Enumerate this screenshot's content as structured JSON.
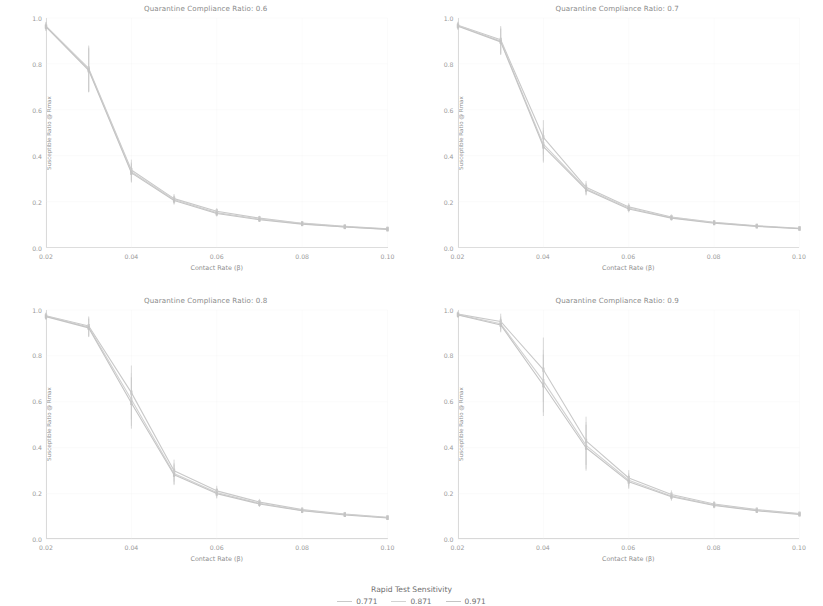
{
  "figure": {
    "xlabel": "Contact Rate (β)",
    "ylabel": "Susceptible Ratio @ Rmax",
    "xticks": [
      "0.02",
      "0.04",
      "0.06",
      "0.08",
      "0.10"
    ],
    "yticks": [
      "0.0",
      "0.2",
      "0.4",
      "0.6",
      "0.8",
      "1.0"
    ]
  },
  "legend": {
    "title": "Rapid Test Sensitivity",
    "items": [
      {
        "label": "0.771",
        "color": "#c9c9c9"
      },
      {
        "label": "0.871",
        "color": "#d2d2d2"
      },
      {
        "label": "0.971",
        "color": "#c4c4c4"
      }
    ]
  },
  "panels": [
    {
      "title": "Quarantine Compliance Ratio: 0.6"
    },
    {
      "title": "Quarantine Compliance Ratio: 0.7"
    },
    {
      "title": "Quarantine Compliance Ratio: 0.8"
    },
    {
      "title": "Quarantine Compliance Ratio: 0.9"
    }
  ],
  "chart_data": {
    "type": "line",
    "xlabel": "Contact Rate (β)",
    "ylabel": "Susceptible Ratio @ Rmax",
    "xlim": [
      0.02,
      0.1
    ],
    "ylim": [
      0.0,
      1.0
    ],
    "xticks": [
      0.02,
      0.04,
      0.06,
      0.08,
      0.1
    ],
    "yticks": [
      0.0,
      0.2,
      0.4,
      0.6,
      0.8,
      1.0
    ],
    "grid": true,
    "legend_title": "Rapid Test Sensitivity",
    "legend_position": "below-figure-center",
    "error_bars": true,
    "x": [
      0.02,
      0.03,
      0.04,
      0.05,
      0.06,
      0.07,
      0.08,
      0.09,
      0.1
    ],
    "facets": [
      {
        "facet_label": "Quarantine Compliance Ratio: 0.6",
        "series": [
          {
            "name": "0.771",
            "values": [
              0.965,
              0.78,
              0.338,
              0.213,
              0.158,
              0.128,
              0.106,
              0.092,
              0.082
            ],
            "err": [
              0.018,
              0.1,
              0.045,
              0.02,
              0.014,
              0.01,
              0.008,
              0.006,
              0.005
            ]
          },
          {
            "name": "0.871",
            "values": [
              0.963,
              0.776,
              0.33,
              0.209,
              0.152,
              0.124,
              0.104,
              0.09,
              0.08
            ],
            "err": [
              0.018,
              0.098,
              0.043,
              0.019,
              0.013,
              0.01,
              0.008,
              0.006,
              0.005
            ]
          },
          {
            "name": "0.971",
            "values": [
              0.961,
              0.772,
              0.325,
              0.205,
              0.148,
              0.121,
              0.102,
              0.089,
              0.079
            ],
            "err": [
              0.018,
              0.096,
              0.042,
              0.018,
              0.013,
              0.009,
              0.008,
              0.006,
              0.005
            ]
          }
        ]
      },
      {
        "facet_label": "Quarantine Compliance Ratio: 0.7",
        "series": [
          {
            "name": "0.771",
            "values": [
              0.968,
              0.905,
              0.48,
              0.262,
              0.177,
              0.133,
              0.11,
              0.095,
              0.084
            ],
            "err": [
              0.016,
              0.06,
              0.075,
              0.028,
              0.016,
              0.011,
              0.008,
              0.007,
              0.005
            ]
          },
          {
            "name": "0.871",
            "values": [
              0.966,
              0.9,
              0.45,
              0.256,
              0.172,
              0.13,
              0.108,
              0.093,
              0.083
            ],
            "err": [
              0.016,
              0.058,
              0.072,
              0.026,
              0.015,
              0.011,
              0.008,
              0.007,
              0.005
            ]
          },
          {
            "name": "0.971",
            "values": [
              0.964,
              0.896,
              0.44,
              0.252,
              0.168,
              0.128,
              0.106,
              0.092,
              0.082
            ],
            "err": [
              0.016,
              0.057,
              0.07,
              0.025,
              0.015,
              0.01,
              0.008,
              0.007,
              0.005
            ]
          }
        ]
      },
      {
        "facet_label": "Quarantine Compliance Ratio: 0.8",
        "series": [
          {
            "name": "0.771",
            "values": [
              0.975,
              0.93,
              0.64,
              0.3,
              0.212,
              0.163,
              0.13,
              0.111,
              0.097
            ],
            "err": [
              0.014,
              0.042,
              0.118,
              0.048,
              0.022,
              0.014,
              0.01,
              0.008,
              0.006
            ]
          },
          {
            "name": "0.871",
            "values": [
              0.973,
              0.926,
              0.61,
              0.288,
              0.205,
              0.158,
              0.127,
              0.109,
              0.095
            ],
            "err": [
              0.014,
              0.041,
              0.115,
              0.046,
              0.021,
              0.014,
              0.01,
              0.008,
              0.006
            ]
          },
          {
            "name": "0.971",
            "values": [
              0.971,
              0.922,
              0.595,
              0.282,
              0.2,
              0.155,
              0.125,
              0.107,
              0.094
            ],
            "err": [
              0.014,
              0.04,
              0.112,
              0.045,
              0.021,
              0.013,
              0.01,
              0.008,
              0.006
            ]
          }
        ]
      },
      {
        "facet_label": "Quarantine Compliance Ratio: 0.9",
        "series": [
          {
            "name": "0.771",
            "values": [
              0.982,
              0.95,
              0.74,
              0.43,
              0.268,
              0.196,
              0.155,
              0.13,
              0.113
            ],
            "err": [
              0.012,
              0.034,
              0.14,
              0.105,
              0.034,
              0.018,
              0.012,
              0.009,
              0.007
            ]
          },
          {
            "name": "0.871",
            "values": [
              0.98,
              0.94,
              0.69,
              0.41,
              0.258,
              0.19,
              0.151,
              0.127,
              0.111
            ],
            "err": [
              0.012,
              0.033,
              0.136,
              0.102,
              0.032,
              0.017,
              0.012,
              0.009,
              0.007
            ]
          },
          {
            "name": "0.971",
            "values": [
              0.978,
              0.935,
              0.672,
              0.4,
              0.252,
              0.186,
              0.148,
              0.125,
              0.109
            ],
            "err": [
              0.012,
              0.032,
              0.134,
              0.1,
              0.031,
              0.017,
              0.012,
              0.009,
              0.007
            ]
          }
        ]
      }
    ]
  }
}
